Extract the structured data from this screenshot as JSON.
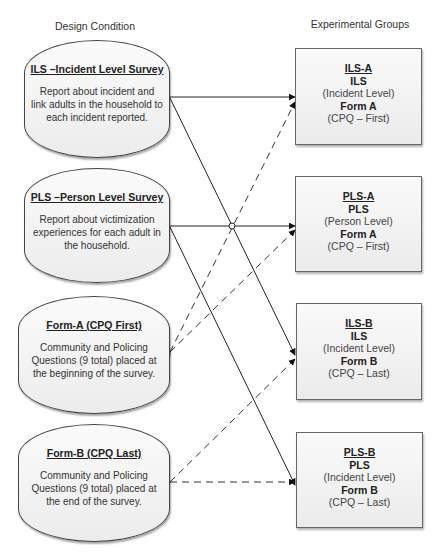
{
  "headers": {
    "left": "Design Condition",
    "right": "Experimental Groups"
  },
  "conditions": [
    {
      "title": "ILS –Incident Level Survey",
      "description": "Report about incident and link adults in the household to each incident reported."
    },
    {
      "title": "PLS –Person Level Survey",
      "description": "Report about victimization experiences for each adult in the household."
    },
    {
      "title": "Form-A (CPQ First)",
      "description": "Community and Policing Questions (9 total) placed at the beginning of the survey."
    },
    {
      "title": "Form-B (CPQ Last)",
      "description": "Community and Policing Questions (9 total) placed at the end of the survey."
    }
  ],
  "groups": [
    {
      "code": "ILS-A",
      "survey": "ILS",
      "level": "(Incident Level)",
      "form": "Form A",
      "cpq": "(CPQ – First)"
    },
    {
      "code": "PLS-A",
      "survey": "PLS",
      "level": "(Person Level)",
      "form": "Form A",
      "cpq": "(CPQ – First)"
    },
    {
      "code": "ILS-B",
      "survey": "ILS",
      "level": "(Incident Level)",
      "form": "Form B",
      "cpq": "(CPQ – Last)"
    },
    {
      "code": "PLS-B",
      "survey": "PLS",
      "level": "(Incident Level)",
      "form": "Form B",
      "cpq": "(CPQ – Last)"
    }
  ],
  "connections": [
    {
      "from": "ILS –Incident Level Survey",
      "to": "ILS-A",
      "style": "solid"
    },
    {
      "from": "ILS –Incident Level Survey",
      "to": "ILS-B",
      "style": "solid"
    },
    {
      "from": "PLS –Person Level Survey",
      "to": "PLS-A",
      "style": "solid"
    },
    {
      "from": "PLS –Person Level Survey",
      "to": "PLS-B",
      "style": "solid"
    },
    {
      "from": "Form-A (CPQ First)",
      "to": "ILS-A",
      "style": "dashed"
    },
    {
      "from": "Form-A (CPQ First)",
      "to": "PLS-A",
      "style": "dashed"
    },
    {
      "from": "Form-B (CPQ Last)",
      "to": "ILS-B",
      "style": "dashed"
    },
    {
      "from": "Form-B (CPQ Last)",
      "to": "PLS-B",
      "style": "dashed"
    }
  ]
}
